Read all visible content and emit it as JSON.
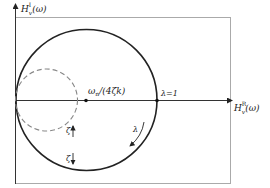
{
  "diagram": {
    "y_axis_label": "H",
    "y_axis_sup": "I",
    "y_axis_sub": "v",
    "y_axis_arg": "(ω)",
    "x_axis_label": "H",
    "x_axis_sup": "R",
    "x_axis_sub": "v",
    "x_axis_arg": "(ω)",
    "center_label": "ω",
    "center_label_sub": "n",
    "center_label_rest": "/(4ζk)",
    "lambda_one_label": "λ=1",
    "lambda_label": "λ",
    "zeta_up_label": "ζ",
    "zeta_down_label": "ζ",
    "colors": {
      "stroke": "#222222",
      "dashed": "#888888",
      "frame": "#aaaaaa"
    }
  }
}
